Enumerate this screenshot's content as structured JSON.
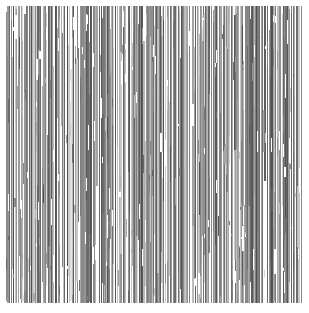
{
  "image": {
    "kind": "abstract-vertical-stripe-texture",
    "description": "Dense field of thin vertical grayscale lines resembling a barcode or scan-line texture",
    "width_px": 309,
    "height_px": 313,
    "background_color": "#ffffff",
    "margins_px": {
      "left": 6,
      "right": 7,
      "top": 6,
      "bottom": 10
    },
    "ink_area_px": {
      "x": 6,
      "y": 6,
      "width": 296,
      "height": 297
    },
    "palette": {
      "background": "#ffffff",
      "darkest_line": "#4f4f4f",
      "dark_line": "#6a6a6a",
      "mid_line": "#868686",
      "light_line": "#a6a6a6",
      "lightest_line": "#c9c9c9"
    },
    "line_width_range_px": [
      1,
      2
    ],
    "approximate_line_count": 430,
    "orientation": "vertical",
    "notes": "No text, axes, legend, or UI chrome present; purely a grayscale stripe pattern."
  },
  "chart_data": {
    "type": "bar",
    "title": "",
    "subtitle": "",
    "xlabel": "",
    "ylabel": "",
    "grid": false,
    "legend": null,
    "xlim": [
      0,
      296
    ],
    "ylim": [
      0,
      297
    ],
    "orientation": "vertical",
    "categories": [],
    "note": "Each entry of stripes is one vertical line: x = left offset within ink area, w = width, y0 = top offset, h = height, g = gray level hex",
    "stripes": [
      {
        "x": 0,
        "w": 1,
        "y0": 6,
        "h": 289,
        "g": "#8a8a8a"
      },
      {
        "x": 2,
        "w": 2,
        "y0": 0,
        "h": 297,
        "g": "#6b6b6b"
      },
      {
        "x": 5,
        "w": 1,
        "y0": 14,
        "h": 283,
        "g": "#a3a3a3"
      },
      {
        "x": 7,
        "w": 1,
        "y0": 0,
        "h": 297,
        "g": "#5c5c5c"
      },
      {
        "x": 9,
        "w": 2,
        "y0": 3,
        "h": 294,
        "g": "#7d7d7d"
      },
      {
        "x": 13,
        "w": 1,
        "y0": 0,
        "h": 250,
        "g": "#9e9e9e"
      },
      {
        "x": 15,
        "w": 1,
        "y0": 0,
        "h": 297,
        "g": "#6f6f6f"
      },
      {
        "x": 18,
        "w": 2,
        "y0": 8,
        "h": 289,
        "g": "#888888"
      },
      {
        "x": 21,
        "w": 1,
        "y0": 0,
        "h": 297,
        "g": "#5a5a5a"
      },
      {
        "x": 23,
        "w": 1,
        "y0": 30,
        "h": 267,
        "g": "#b4b4b4"
      },
      {
        "x": 25,
        "w": 2,
        "y0": 0,
        "h": 297,
        "g": "#757575"
      },
      {
        "x": 29,
        "w": 1,
        "y0": 0,
        "h": 297,
        "g": "#909090"
      },
      {
        "x": 31,
        "w": 1,
        "y0": 0,
        "h": 160,
        "g": "#a9a9a9"
      },
      {
        "x": 33,
        "w": 2,
        "y0": 0,
        "h": 297,
        "g": "#636363"
      },
      {
        "x": 37,
        "w": 1,
        "y0": 20,
        "h": 277,
        "g": "#999999"
      },
      {
        "x": 39,
        "w": 1,
        "y0": 0,
        "h": 297,
        "g": "#7a7a7a"
      },
      {
        "x": 42,
        "w": 2,
        "y0": 0,
        "h": 240,
        "g": "#8d8d8d"
      },
      {
        "x": 45,
        "w": 1,
        "y0": 0,
        "h": 297,
        "g": "#5f5f5f"
      },
      {
        "x": 47,
        "w": 1,
        "y0": 60,
        "h": 237,
        "g": "#bcbcbc"
      },
      {
        "x": 49,
        "w": 2,
        "y0": 0,
        "h": 297,
        "g": "#717171"
      },
      {
        "x": 53,
        "w": 1,
        "y0": 0,
        "h": 297,
        "g": "#969696"
      },
      {
        "x": 55,
        "w": 1,
        "y0": 0,
        "h": 120,
        "g": "#adadad"
      },
      {
        "x": 57,
        "w": 2,
        "y0": 0,
        "h": 297,
        "g": "#666666"
      },
      {
        "x": 61,
        "w": 1,
        "y0": 12,
        "h": 285,
        "g": "#8b8b8b"
      },
      {
        "x": 63,
        "w": 1,
        "y0": 0,
        "h": 297,
        "g": "#787878"
      },
      {
        "x": 66,
        "w": 2,
        "y0": 0,
        "h": 297,
        "g": "#585858"
      },
      {
        "x": 69,
        "w": 1,
        "y0": 40,
        "h": 257,
        "g": "#a8a8a8"
      },
      {
        "x": 71,
        "w": 1,
        "y0": 0,
        "h": 297,
        "g": "#838383"
      },
      {
        "x": 74,
        "w": 2,
        "y0": 0,
        "h": 210,
        "g": "#6d6d6d"
      },
      {
        "x": 77,
        "w": 1,
        "y0": 0,
        "h": 297,
        "g": "#9b9b9b"
      },
      {
        "x": 79,
        "w": 1,
        "y0": 0,
        "h": 297,
        "g": "#5d5d5d"
      },
      {
        "x": 81,
        "w": 2,
        "y0": 25,
        "h": 272,
        "g": "#bdbdbd"
      },
      {
        "x": 85,
        "w": 1,
        "y0": 0,
        "h": 297,
        "g": "#747474"
      },
      {
        "x": 87,
        "w": 1,
        "y0": 0,
        "h": 297,
        "g": "#8f8f8f"
      },
      {
        "x": 90,
        "w": 2,
        "y0": 0,
        "h": 180,
        "g": "#a4a4a4"
      },
      {
        "x": 93,
        "w": 1,
        "y0": 0,
        "h": 297,
        "g": "#626262"
      },
      {
        "x": 95,
        "w": 1,
        "y0": 18,
        "h": 279,
        "g": "#979797"
      },
      {
        "x": 97,
        "w": 2,
        "y0": 0,
        "h": 297,
        "g": "#797979"
      },
      {
        "x": 101,
        "w": 1,
        "y0": 0,
        "h": 297,
        "g": "#545454"
      },
      {
        "x": 103,
        "w": 1,
        "y0": 70,
        "h": 227,
        "g": "#c0c0c0"
      },
      {
        "x": 105,
        "w": 2,
        "y0": 0,
        "h": 297,
        "g": "#858585"
      },
      {
        "x": 109,
        "w": 1,
        "y0": 0,
        "h": 297,
        "g": "#6e6e6e"
      },
      {
        "x": 111,
        "w": 1,
        "y0": 0,
        "h": 140,
        "g": "#b2b2b2"
      },
      {
        "x": 113,
        "w": 2,
        "y0": 0,
        "h": 297,
        "g": "#909090"
      },
      {
        "x": 117,
        "w": 1,
        "y0": 10,
        "h": 287,
        "g": "#5b5b5b"
      },
      {
        "x": 119,
        "w": 1,
        "y0": 0,
        "h": 297,
        "g": "#828282"
      },
      {
        "x": 122,
        "w": 2,
        "y0": 0,
        "h": 297,
        "g": "#6a6a6a"
      },
      {
        "x": 125,
        "w": 1,
        "y0": 50,
        "h": 247,
        "g": "#aeaeae"
      },
      {
        "x": 127,
        "w": 1,
        "y0": 0,
        "h": 297,
        "g": "#959595"
      },
      {
        "x": 130,
        "w": 2,
        "y0": 0,
        "h": 230,
        "g": "#707070"
      },
      {
        "x": 133,
        "w": 1,
        "y0": 0,
        "h": 297,
        "g": "#5e5e5e"
      },
      {
        "x": 135,
        "w": 1,
        "y0": 0,
        "h": 297,
        "g": "#8c8c8c"
      },
      {
        "x": 137,
        "w": 2,
        "y0": 35,
        "h": 262,
        "g": "#b8b8b8"
      },
      {
        "x": 141,
        "w": 1,
        "y0": 0,
        "h": 297,
        "g": "#767676"
      },
      {
        "x": 143,
        "w": 1,
        "y0": 0,
        "h": 297,
        "g": "#9d9d9d"
      },
      {
        "x": 146,
        "w": 2,
        "y0": 0,
        "h": 190,
        "g": "#646464"
      },
      {
        "x": 149,
        "w": 1,
        "y0": 0,
        "h": 297,
        "g": "#878787"
      },
      {
        "x": 151,
        "w": 1,
        "y0": 22,
        "h": 275,
        "g": "#a0a0a0"
      },
      {
        "x": 153,
        "w": 2,
        "y0": 0,
        "h": 297,
        "g": "#595959"
      },
      {
        "x": 157,
        "w": 1,
        "y0": 0,
        "h": 297,
        "g": "#7e7e7e"
      },
      {
        "x": 159,
        "w": 1,
        "y0": 80,
        "h": 217,
        "g": "#c4c4c4"
      },
      {
        "x": 161,
        "w": 2,
        "y0": 0,
        "h": 297,
        "g": "#929292"
      },
      {
        "x": 165,
        "w": 1,
        "y0": 0,
        "h": 297,
        "g": "#686868"
      },
      {
        "x": 167,
        "w": 1,
        "y0": 0,
        "h": 150,
        "g": "#b0b0b0"
      },
      {
        "x": 169,
        "w": 2,
        "y0": 0,
        "h": 297,
        "g": "#7b7b7b"
      },
      {
        "x": 173,
        "w": 1,
        "y0": 5,
        "h": 292,
        "g": "#565656"
      },
      {
        "x": 175,
        "w": 1,
        "y0": 0,
        "h": 297,
        "g": "#8e8e8e"
      },
      {
        "x": 178,
        "w": 2,
        "y0": 0,
        "h": 297,
        "g": "#6c6c6c"
      },
      {
        "x": 181,
        "w": 1,
        "y0": 45,
        "h": 252,
        "g": "#ababab"
      },
      {
        "x": 183,
        "w": 1,
        "y0": 0,
        "h": 297,
        "g": "#818181"
      },
      {
        "x": 186,
        "w": 2,
        "y0": 0,
        "h": 220,
        "g": "#999999"
      },
      {
        "x": 189,
        "w": 1,
        "y0": 0,
        "h": 297,
        "g": "#616161"
      },
      {
        "x": 191,
        "w": 1,
        "y0": 0,
        "h": 297,
        "g": "#898989"
      },
      {
        "x": 193,
        "w": 2,
        "y0": 28,
        "h": 269,
        "g": "#bababa"
      },
      {
        "x": 197,
        "w": 1,
        "y0": 0,
        "h": 297,
        "g": "#737373"
      },
      {
        "x": 199,
        "w": 1,
        "y0": 0,
        "h": 297,
        "g": "#a1a1a1"
      },
      {
        "x": 202,
        "w": 2,
        "y0": 0,
        "h": 170,
        "g": "#5f5f5f"
      },
      {
        "x": 205,
        "w": 1,
        "y0": 0,
        "h": 297,
        "g": "#848484"
      },
      {
        "x": 207,
        "w": 1,
        "y0": 16,
        "h": 281,
        "g": "#949494"
      },
      {
        "x": 209,
        "w": 2,
        "y0": 0,
        "h": 297,
        "g": "#575757"
      },
      {
        "x": 213,
        "w": 1,
        "y0": 0,
        "h": 297,
        "g": "#7c7c7c"
      },
      {
        "x": 215,
        "w": 1,
        "y0": 65,
        "h": 232,
        "g": "#c2c2c2"
      },
      {
        "x": 217,
        "w": 2,
        "y0": 0,
        "h": 297,
        "g": "#8d8d8d"
      },
      {
        "x": 221,
        "w": 1,
        "y0": 0,
        "h": 297,
        "g": "#696969"
      },
      {
        "x": 223,
        "w": 1,
        "y0": 0,
        "h": 130,
        "g": "#b6b6b6"
      },
      {
        "x": 225,
        "w": 2,
        "y0": 0,
        "h": 297,
        "g": "#7f7f7f"
      },
      {
        "x": 229,
        "w": 1,
        "y0": 9,
        "h": 288,
        "g": "#5a5a5a"
      },
      {
        "x": 231,
        "w": 1,
        "y0": 0,
        "h": 297,
        "g": "#919191"
      },
      {
        "x": 234,
        "w": 2,
        "y0": 0,
        "h": 297,
        "g": "#6d6d6d"
      },
      {
        "x": 237,
        "w": 1,
        "y0": 55,
        "h": 242,
        "g": "#a7a7a7"
      },
      {
        "x": 239,
        "w": 1,
        "y0": 0,
        "h": 297,
        "g": "#868686"
      },
      {
        "x": 242,
        "w": 2,
        "y0": 0,
        "h": 200,
        "g": "#989898"
      },
      {
        "x": 245,
        "w": 1,
        "y0": 0,
        "h": 297,
        "g": "#606060"
      },
      {
        "x": 247,
        "w": 1,
        "y0": 0,
        "h": 297,
        "g": "#8b8b8b"
      },
      {
        "x": 249,
        "w": 2,
        "y0": 32,
        "h": 265,
        "g": "#bebebe"
      },
      {
        "x": 253,
        "w": 1,
        "y0": 0,
        "h": 297,
        "g": "#777777"
      },
      {
        "x": 255,
        "w": 1,
        "y0": 0,
        "h": 297,
        "g": "#a2a2a2"
      },
      {
        "x": 258,
        "w": 2,
        "y0": 0,
        "h": 175,
        "g": "#5d5d5d"
      },
      {
        "x": 261,
        "w": 1,
        "y0": 0,
        "h": 297,
        "g": "#838383"
      },
      {
        "x": 263,
        "w": 1,
        "y0": 24,
        "h": 273,
        "g": "#939393"
      },
      {
        "x": 265,
        "w": 2,
        "y0": 0,
        "h": 297,
        "g": "#555555"
      },
      {
        "x": 269,
        "w": 1,
        "y0": 0,
        "h": 297,
        "g": "#7a7a7a"
      },
      {
        "x": 271,
        "w": 1,
        "y0": 75,
        "h": 222,
        "g": "#c6c6c6"
      },
      {
        "x": 273,
        "w": 2,
        "y0": 0,
        "h": 297,
        "g": "#8f8f8f"
      },
      {
        "x": 277,
        "w": 1,
        "y0": 0,
        "h": 297,
        "g": "#676767"
      },
      {
        "x": 279,
        "w": 1,
        "y0": 0,
        "h": 145,
        "g": "#b3b3b3"
      },
      {
        "x": 281,
        "w": 2,
        "y0": 0,
        "h": 297,
        "g": "#808080"
      },
      {
        "x": 285,
        "w": 1,
        "y0": 7,
        "h": 290,
        "g": "#585858"
      },
      {
        "x": 287,
        "w": 1,
        "y0": 0,
        "h": 297,
        "g": "#969696"
      },
      {
        "x": 290,
        "w": 2,
        "y0": 0,
        "h": 297,
        "g": "#6e6e6e"
      },
      {
        "x": 293,
        "w": 1,
        "y0": 38,
        "h": 259,
        "g": "#aaaaaa"
      },
      {
        "x": 295,
        "w": 1,
        "y0": 0,
        "h": 297,
        "g": "#888888"
      }
    ]
  }
}
